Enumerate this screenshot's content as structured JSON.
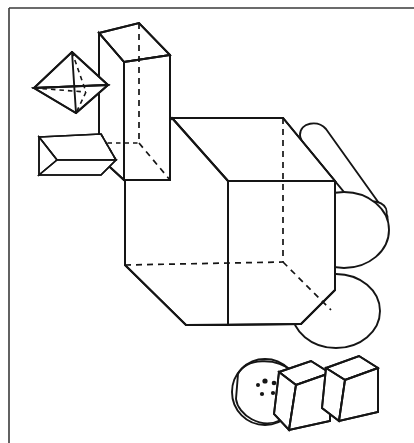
{
  "page": {
    "title": "Geometric Solids Line Drawing",
    "background_color": "#ffffff",
    "ink_color": "#151515",
    "frame_color": "#3a3a3a",
    "width": 414,
    "height": 443
  },
  "frame": {
    "name": "page-border",
    "top_rule_y": 8,
    "left_rule_x": 9,
    "description": "Thin page border rules along the top and left edges"
  },
  "drawing": {
    "style": "black and white technical line drawing, wireframe with dashed hidden edges",
    "line_weight": "1.6 - 1.9 px",
    "hidden_edge_style": "dashed",
    "solids": [
      {
        "id": "pyramid",
        "label": "Pyramid",
        "position": "upper left",
        "apex": [
          34,
          88
        ],
        "notes": "Square-based pyramid pointing left with dashed hidden base edges"
      },
      {
        "id": "tall-box",
        "label": "Tall rectangular prism",
        "position": "upper left center",
        "notes": "Vertical box, standing tall, dashed hidden back vertical edge"
      },
      {
        "id": "small-prism",
        "label": "Horizontal prism",
        "position": "left center",
        "notes": "Short horizontal prism with chevron end face"
      },
      {
        "id": "large-cube",
        "label": "Large cube",
        "position": "center",
        "notes": "Dominant wireframe cube with three dashed hidden edges meeting at rear vertex"
      },
      {
        "id": "cylinder-upper",
        "label": "Upper cylinder",
        "position": "right",
        "notes": "Cylinder lying at a diagonal behind the cube"
      },
      {
        "id": "cylinder-lower",
        "label": "Lower cylinder",
        "position": "lower right",
        "notes": "Second cylinder below the first"
      },
      {
        "id": "sphere",
        "label": "Sphere",
        "position": "bottom",
        "notes": "Sphere with an inner ellipse contour and small dot markings"
      },
      {
        "id": "small-cube-left",
        "label": "Small cube (left)",
        "position": "bottom right",
        "notes": "Small cube abutting the sphere"
      },
      {
        "id": "small-cube-right",
        "label": "Small cube (right)",
        "position": "bottom right corner",
        "notes": "Second small cube to the right"
      }
    ]
  }
}
